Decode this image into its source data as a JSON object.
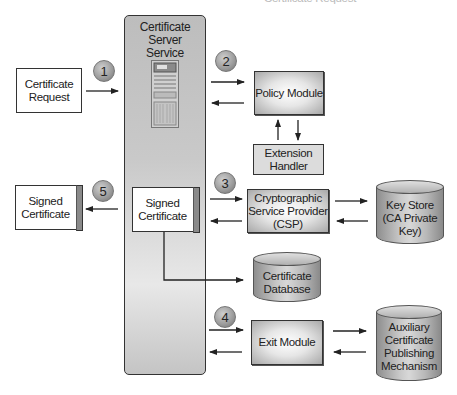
{
  "diagram": {
    "top_cropped_text": "Certificate Request",
    "service": {
      "title_line1": "Certificate",
      "title_line2": "Server",
      "title_line3": "Service",
      "icon": "server-tower-icon"
    },
    "nodes": {
      "certificate_request": {
        "line1": "Certificate",
        "line2": "Request"
      },
      "signed_certificate_out": {
        "line1": "Signed",
        "line2": "Certificate"
      },
      "signed_certificate_inner": {
        "line1": "Signed",
        "line2": "Certificate"
      },
      "policy_module": {
        "line1": "Policy Module"
      },
      "extension_handler": {
        "line1": "Extension",
        "line2": "Handler"
      },
      "csp": {
        "line1": "Cryptographic",
        "line2": "Service Provider",
        "line3": "(CSP)"
      },
      "key_store": {
        "line1": "Key Store",
        "line2": "(CA Private",
        "line3": "Key)"
      },
      "certificate_database": {
        "line1": "Certificate",
        "line2": "Database"
      },
      "exit_module": {
        "line1": "Exit Module"
      },
      "auxiliary": {
        "line1": "Auxiliary",
        "line2": "Certificate",
        "line3": "Publishing",
        "line4": "Mechanism"
      }
    },
    "steps": [
      "1",
      "2",
      "3",
      "4",
      "5"
    ],
    "colors": {
      "stroke": "#333333",
      "badge_fill": "#9a9a9a",
      "cylinder_fill": "#c0c0c0",
      "service_fill": "#c9c9c9"
    }
  }
}
